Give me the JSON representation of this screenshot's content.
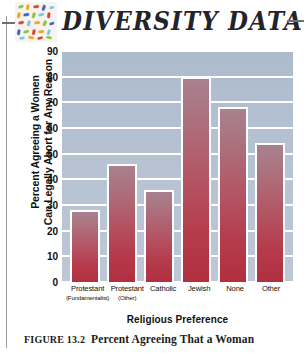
{
  "header": {
    "brand_title": "DIVERSITY DATA",
    "logo_icon": "mosaic-tiles-icon",
    "rule_left_icon": "rule-dash-icon",
    "rule_right_icon": "rule-dash-icon"
  },
  "caption": {
    "figure_number": "FIGURE 13.2",
    "text": "Percent Agreeing That a Woman"
  },
  "chart_data": {
    "type": "bar",
    "title": "",
    "categories": [
      "Protestant",
      "Protestant",
      "Catholic",
      "Jewish",
      "None",
      "Other"
    ],
    "category_sublabels": [
      "(Fundamentalist)",
      "(Other)",
      "",
      "",
      "",
      ""
    ],
    "values": [
      28,
      46,
      36,
      80,
      68,
      54
    ],
    "xlabel": "Religious Preference",
    "ylabel_line1": "Percent Agreeing a Women",
    "ylabel_line2": "Can Legally Abort for Any Reason",
    "ylim": [
      0,
      90
    ],
    "ytick_step": 10,
    "yticks": [
      0,
      10,
      20,
      30,
      40,
      50,
      60,
      70,
      80,
      90
    ],
    "grid": true,
    "legend": "none",
    "colors": {
      "plot_background": "#b4c0d1",
      "gridline": "#ffffff",
      "bar_top": "#a8818f",
      "bar_bottom": "#b22f3f",
      "bar_border": "#ffffff",
      "text": "#111111",
      "rule": "#9a9a9a"
    }
  }
}
